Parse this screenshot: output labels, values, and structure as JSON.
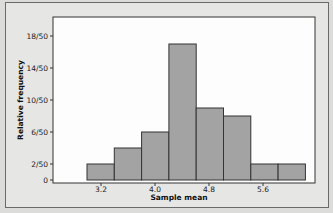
{
  "chart_data": {
    "type": "bar",
    "subtype": "histogram",
    "title": "",
    "xlabel": "Sample mean",
    "ylabel": "Relative frequency",
    "x_tick_labels": [
      "3.2",
      "4.0",
      "4.8",
      "5.6"
    ],
    "y_tick_labels": [
      "0",
      "2/50",
      "6/50",
      "10/50",
      "14/50",
      "18/50"
    ],
    "y_tick_values": [
      0,
      2,
      6,
      10,
      14,
      18
    ],
    "bin_edges": [
      2.9,
      3.4,
      3.9,
      4.4,
      4.9,
      5.4,
      5.9,
      6.4,
      6.9
    ],
    "bin_width_note": "bins of equal width; x ticks 3.2, 4.0, 4.8, 5.6",
    "categories": [
      "bin1",
      "bin2",
      "bin3",
      "bin4",
      "bin5",
      "bin6",
      "bin7",
      "bin8"
    ],
    "values": [
      2,
      4,
      6,
      17,
      9,
      8,
      2,
      2
    ],
    "value_unit": "count out of 50 (relative frequency = value/50)",
    "ylim": [
      0,
      20
    ],
    "grid": false,
    "legend": "none",
    "bar_color": "#a3a3a3",
    "bar_edge_color": "#333333"
  },
  "axes": {
    "x_title": "Sample mean",
    "y_title": "Relative frequency"
  }
}
